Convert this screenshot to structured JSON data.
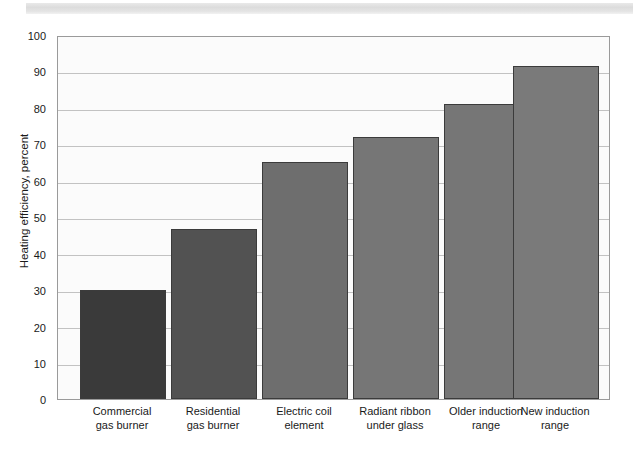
{
  "chart_data": {
    "type": "bar",
    "title": "",
    "subtitle": "",
    "xlabel": "",
    "ylabel": "Heating efficiency, percent",
    "ylim": [
      0,
      100
    ],
    "ytick_step": 10,
    "yticks": [
      "100",
      "90",
      "80",
      "70",
      "60",
      "50",
      "40",
      "30",
      "20",
      "10",
      "0"
    ],
    "grid": true,
    "legend": "none",
    "categories": [
      "Commercial\ngas burner",
      "Residential\ngas burner",
      "Electric coil\nelement",
      "Radiant ribbon\nunder glass",
      "Older induction\nrange",
      "New induction\nrange"
    ],
    "category_lines": [
      [
        "Commercial",
        "gas burner"
      ],
      [
        "Residential",
        "gas burner"
      ],
      [
        "Electric coil",
        "element"
      ],
      [
        "Radiant ribbon",
        "under glass"
      ],
      [
        "Older induction",
        "range"
      ],
      [
        "New induction",
        "range"
      ]
    ],
    "values": [
      30,
      47,
      65.5,
      72.5,
      81.5,
      92
    ],
    "bar_colors": [
      "#3a3a3a",
      "#525252",
      "#6e6e6e",
      "#767676",
      "#767676",
      "#7a7a7a"
    ],
    "bar_edge_color": "#3b3b3b",
    "plot_background": "#fbfbfb",
    "grid_color": "#c2c2c2",
    "axis_color": "#9a9a9a",
    "text_color": "#1a1a1a"
  }
}
